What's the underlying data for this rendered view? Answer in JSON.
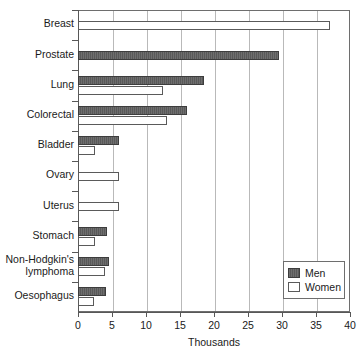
{
  "chart_data": {
    "type": "bar",
    "orientation": "horizontal",
    "title": "",
    "xlabel": "Thousands",
    "ylabel": "",
    "xlim": [
      0,
      40
    ],
    "xticks": [
      0,
      5,
      10,
      15,
      20,
      25,
      30,
      35,
      40
    ],
    "xtick_labels": [
      "0",
      "5",
      "10",
      "15",
      "20",
      "25",
      "30",
      "35",
      "40"
    ],
    "grid": true,
    "grid_axis": "x",
    "legend_position": "bottom-right",
    "categories": [
      "Breast",
      "Prostate",
      "Lung",
      "Colorectal",
      "Bladder",
      "Ovary",
      "Uterus",
      "Stomach",
      "Non-Hodgkin's\nlymphoma",
      "Oesophagus"
    ],
    "series": [
      {
        "name": "Men",
        "color": "#595959",
        "values": [
          null,
          29.5,
          18.5,
          16.1,
          6.0,
          null,
          null,
          4.3,
          4.6,
          4.1
        ]
      },
      {
        "name": "Women",
        "color": "#ffffff",
        "values": [
          37.0,
          null,
          12.5,
          13.1,
          2.5,
          6.0,
          6.0,
          2.5,
          4.0,
          2.3
        ]
      }
    ]
  },
  "legend": {
    "items": [
      {
        "label": "Men",
        "swatch": "men-swatch"
      },
      {
        "label": "Women",
        "swatch": "women-swatch"
      }
    ]
  },
  "axis": {
    "x_title": "Thousands"
  }
}
